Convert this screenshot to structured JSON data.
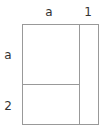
{
  "diagram": {
    "type": "area-model rectangle",
    "top_labels": [
      {
        "text": "a",
        "x": 49,
        "y": 12
      },
      {
        "text": "1",
        "x": 88,
        "y": 12
      }
    ],
    "left_labels": [
      {
        "text": "a",
        "x": 8,
        "y": 55
      },
      {
        "text": "2",
        "x": 8,
        "y": 106
      }
    ],
    "line_color": "#999999",
    "text_color": "#333333"
  }
}
